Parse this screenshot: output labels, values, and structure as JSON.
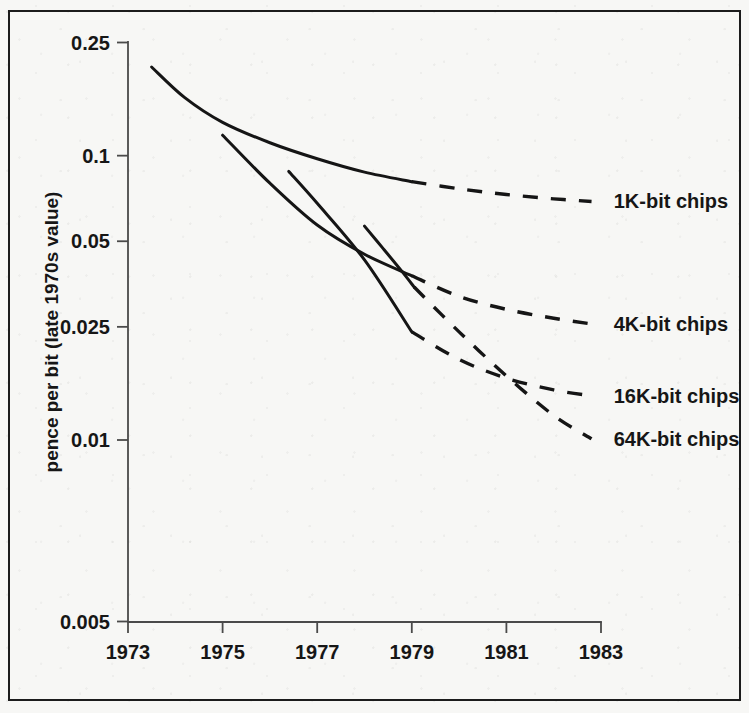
{
  "chart_data": {
    "type": "line",
    "title": "",
    "xlabel": "",
    "ylabel": "pence per bit (late 1970s value)",
    "xlim": [
      1973,
      1983
    ],
    "ylim": [
      0.005,
      0.25
    ],
    "yscale": "log",
    "grid": false,
    "legend_position": "right-inline-labels",
    "x_ticks": [
      "1973",
      "1975",
      "1977",
      "1979",
      "1981",
      "1983"
    ],
    "x_tick_values": [
      1973,
      1975,
      1977,
      1979,
      1981,
      1983
    ],
    "y_ticks": [
      "0.25",
      "0.1",
      "0.05",
      "0.025",
      "0.01",
      "0.005"
    ],
    "y_tick_values": [
      0.25,
      0.1,
      0.05,
      0.025,
      0.01,
      0.005
    ],
    "series": [
      {
        "name": "1K-bit chips",
        "label": "1K-bit chips",
        "solid_x": [
          1973.5,
          1974.2,
          1975.0,
          1976.0,
          1977.0,
          1978.0,
          1979.0
        ],
        "solid_y": [
          0.205,
          0.16,
          0.131,
          0.111,
          0.0975,
          0.0875,
          0.081
        ],
        "dashed_x": [
          1979.0,
          1980.0,
          1981.0,
          1982.0,
          1982.8
        ],
        "dashed_y": [
          0.081,
          0.0765,
          0.073,
          0.0705,
          0.069
        ],
        "label_x": 1983.1,
        "label_y": 0.069
      },
      {
        "name": "4K-bit chips",
        "label": "4K-bit chips",
        "solid_x": [
          1975.0,
          1976.0,
          1977.0,
          1978.0,
          1979.0
        ],
        "solid_y": [
          0.118,
          0.08,
          0.057,
          0.045,
          0.0378
        ],
        "dashed_x": [
          1979.0,
          1980.0,
          1981.0,
          1982.0,
          1982.8
        ],
        "dashed_y": [
          0.0378,
          0.032,
          0.0288,
          0.0268,
          0.0256
        ],
        "label_x": 1983.1,
        "label_y": 0.0256
      },
      {
        "name": "16K-bit chips",
        "label": "16K-bit chips",
        "solid_x": [
          1976.4,
          1977.0,
          1978.0,
          1979.0
        ],
        "solid_y": [
          0.088,
          0.068,
          0.043,
          0.024
        ],
        "dashed_x": [
          1979.0,
          1980.0,
          1981.0,
          1982.0,
          1982.8
        ],
        "dashed_y": [
          0.024,
          0.0192,
          0.0165,
          0.015,
          0.0143
        ],
        "label_x": 1983.1,
        "label_y": 0.0143
      },
      {
        "name": "64K-bit chips",
        "label": "64K-bit chips",
        "solid_x": [
          1978.0,
          1978.4,
          1978.8,
          1979.05
        ],
        "solid_y": [
          0.0565,
          0.047,
          0.039,
          0.0345
        ],
        "dashed_x": [
          1979.05,
          1980.0,
          1981.0,
          1982.0,
          1982.8
        ],
        "dashed_y": [
          0.0345,
          0.024,
          0.0168,
          0.0122,
          0.0101
        ],
        "label_x": 1983.1,
        "label_y": 0.0101
      }
    ]
  }
}
